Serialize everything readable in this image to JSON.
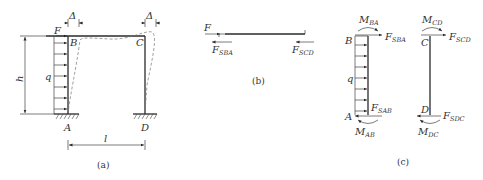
{
  "figure_a": {
    "caption": "(a)",
    "labels": {
      "F": "F",
      "B": "B",
      "C": "C",
      "A": "A",
      "D": "D",
      "q": "q",
      "h": "h",
      "l": "l",
      "delta_left": "Δ",
      "delta_right": "Δ"
    }
  },
  "figure_b": {
    "caption": "(b)",
    "labels": {
      "F": "F",
      "FSBA_main": "F",
      "FSBA_sub": "SBA",
      "FSCD_main": "F",
      "FSCD_sub": "SCD"
    }
  },
  "figure_c": {
    "caption": "(c)",
    "labels": {
      "B": "B",
      "A": "A",
      "C": "C",
      "D": "D",
      "q": "q",
      "MBA_main": "M",
      "MBA_sub": "BA",
      "FSBA_main": "F",
      "FSBA_sub": "SBA",
      "FSAB_main": "F",
      "FSAB_sub": "SAB",
      "MAB_main": "M",
      "MAB_sub": "AB",
      "MCD_main": "M",
      "MCD_sub": "CD",
      "FSCD_main": "F",
      "FSCD_sub": "SCD",
      "FSDC_main": "F",
      "FSDC_sub": "SDC",
      "MDC_main": "M",
      "MDC_sub": "DC"
    }
  },
  "colors": {
    "line": "#2a2a2a",
    "text": "#333333",
    "background": "#ffffff"
  }
}
